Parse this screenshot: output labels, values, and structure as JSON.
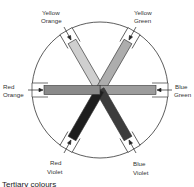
{
  "diagram": {
    "title": "Tertiary colours",
    "center": [
      100,
      90
    ],
    "radius": 68,
    "spokes": [
      {
        "id": "yellow-orange",
        "line1": "Yellow",
        "line2": "Orange",
        "angle": -120,
        "fill": "#c8c8c8"
      },
      {
        "id": "yellow-green",
        "line1": "Yellow",
        "line2": "Green",
        "angle": -60,
        "fill": "#a9a9a9"
      },
      {
        "id": "blue-green",
        "line1": "Blue",
        "line2": "Green",
        "angle": 0,
        "fill": "#9a9a9a"
      },
      {
        "id": "blue-violet",
        "line1": "Blue",
        "line2": "Violet",
        "angle": 60,
        "fill": "#3a3a3a"
      },
      {
        "id": "red-violet",
        "line1": "Red",
        "line2": "Violet",
        "angle": 120,
        "fill": "#1f1f1f"
      },
      {
        "id": "red-orange",
        "line1": "Red",
        "line2": "Orange",
        "angle": 180,
        "fill": "#8c8c8c"
      }
    ]
  }
}
